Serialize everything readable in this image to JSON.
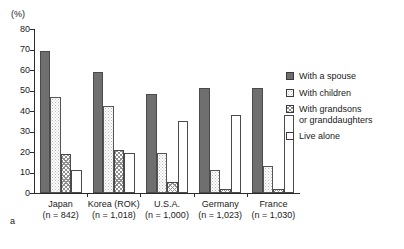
{
  "chart_data": {
    "type": "bar",
    "title": "",
    "subtitle": "",
    "panel_letter": "a",
    "xlabel": "",
    "ylabel": "(%)",
    "ylim": [
      0,
      80
    ],
    "yticks": [
      0,
      10,
      20,
      30,
      40,
      50,
      60,
      70,
      80
    ],
    "grid": false,
    "legend_position": "right",
    "categories": [
      "Japan",
      "Korea (ROK)",
      "U.S.A.",
      "Germany",
      "France"
    ],
    "category_sublabels": [
      "(n = 842)",
      "(n = 1,018)",
      "(n = 1,000)",
      "(n = 1,023)",
      "(n = 1,030)"
    ],
    "series": [
      {
        "name": "With a spouse",
        "pattern": "solid",
        "color": "#6f6f6f",
        "values": [
          69.5,
          59.0,
          48.5,
          51.0,
          51.0
        ]
      },
      {
        "name": "With children",
        "pattern": "dots",
        "color": "#ffffff",
        "values": [
          47.0,
          42.5,
          19.5,
          11.0,
          13.0
        ]
      },
      {
        "name": "With grandsons\nor granddaughters",
        "pattern": "crosshatch",
        "color": "#ffffff",
        "values": [
          19.0,
          21.0,
          5.5,
          2.0,
          2.0
        ]
      },
      {
        "name": "Live alone",
        "pattern": "open",
        "color": "#ffffff",
        "values": [
          11.0,
          19.5,
          35.0,
          38.0,
          38.0
        ]
      }
    ]
  },
  "legend": {
    "items": [
      {
        "label": "With a spouse",
        "swatch": "solid"
      },
      {
        "label": "With children",
        "swatch": "dots"
      },
      {
        "label": "With grandsons\nor granddaughters",
        "swatch": "crosshatch"
      },
      {
        "label": "Live alone",
        "swatch": "open"
      }
    ]
  }
}
